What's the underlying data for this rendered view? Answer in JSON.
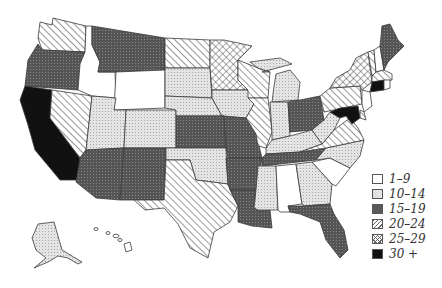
{
  "map": {
    "type": "choropleth",
    "region": "United States",
    "legend": [
      {
        "label": "1–9",
        "class": "c1",
        "fill": "#ffffff"
      },
      {
        "label": "10–14",
        "class": "c2",
        "fill": "#dcdcdc"
      },
      {
        "label": "15–19",
        "class": "c3",
        "fill": "#5a5a5a"
      },
      {
        "label": "20–24",
        "class": "c4",
        "fill": "diagonal-hatch"
      },
      {
        "label": "25–29",
        "class": "c5",
        "fill": "crosshatch"
      },
      {
        "label": "30 +",
        "class": "c6",
        "fill": "#111111"
      }
    ],
    "states": {
      "WA": "20–24",
      "OR": "15–19",
      "CA": "30 +",
      "NV": "20–24",
      "ID": "1–9",
      "MT": "15–19",
      "WY": "1–9",
      "UT": "10–14",
      "CO": "10–14",
      "AZ": "15–19",
      "NM": "15–19",
      "ND": "20–24",
      "SD": "10–14",
      "NE": "10–14",
      "KS": "15–19",
      "OK": "10–14",
      "TX": "20–24",
      "MN": "25–29",
      "IA": "10–14",
      "MO": "15–19",
      "AR": "15–19",
      "LA": "15–19",
      "WI": "20–24",
      "IL": "20–24",
      "MI": "10–14",
      "IN": "10–14",
      "OH": "15–19",
      "KY": "10–14",
      "TN": "15–19",
      "MS": "10–14",
      "AL": "1–9",
      "GA": "10–14",
      "FL": "15–19",
      "SC": "1–9",
      "NC": "10–14",
      "VA": "20–24",
      "WV": "10–14",
      "PA": "20–24",
      "NY": "25–29",
      "VT": "20–24",
      "NH": "1–9",
      "ME": "15–19",
      "MA": "20–24",
      "CT": "30 +",
      "RI": "1–9",
      "NJ": "1–9",
      "DE": "20–24",
      "MD": "30 +",
      "AK": "10–14",
      "HI": "1–9"
    }
  }
}
